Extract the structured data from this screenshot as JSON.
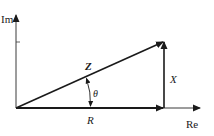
{
  "diagram": {
    "type": "impedance-phasor-diagram",
    "axes": {
      "imaginary_label": "Im",
      "real_label": "Re"
    },
    "vectors": {
      "impedance_label": "Z",
      "resistance_label": "R",
      "reactance_label": "X",
      "angle_label": "θ"
    },
    "colors": {
      "line": "#1a1a1a",
      "axis": "#3a3a3a",
      "background": "#ffffff"
    }
  }
}
